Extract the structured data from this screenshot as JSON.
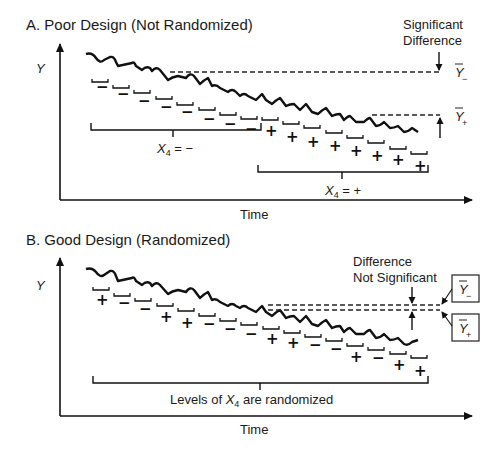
{
  "panel_a": {
    "title": "A.  Poor Design (Not Randomized)",
    "y_label": "Y",
    "x_label": "Time",
    "annotation_line1": "Significant",
    "annotation_line2": "Difference",
    "ybar_minus": "Ȳ−",
    "ybar_plus": "Ȳ+",
    "group_minus_label": "X4 = −",
    "group_plus_label": "X4 = +",
    "group_minus_x": "X",
    "group_minus_sub": "4",
    "group_minus_rest": " = −",
    "group_plus_x": "X",
    "group_plus_sub": "4",
    "group_plus_rest": " = +",
    "first_half_symbols": [
      "−",
      "−",
      "−",
      "−",
      "−",
      "−",
      "−",
      "−"
    ],
    "second_half_symbols": [
      "+",
      "+",
      "+",
      "+",
      "+",
      "+",
      "+",
      "+"
    ]
  },
  "panel_b": {
    "title": "B.  Good Design (Randomized)",
    "y_label": "Y",
    "x_label": "Time",
    "annotation_line1": "Difference",
    "annotation_line2": "Not Significant",
    "ybar_minus": "Ȳ−",
    "ybar_plus": "Ȳ+",
    "group_label_pre": "Levels  of ",
    "group_label_x": "X",
    "group_label_sub": "4",
    "group_label_post": " are randomized",
    "symbols": [
      "+",
      "−",
      "−",
      "+",
      "+",
      "−",
      "−",
      "−",
      "+",
      "−",
      "+",
      "+"
    ]
  }
}
